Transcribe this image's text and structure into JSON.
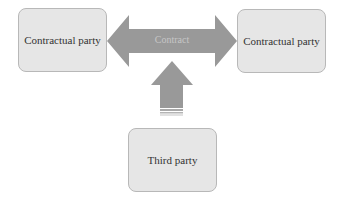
{
  "diagram": {
    "nodes": {
      "left": {
        "label": "Contractual party"
      },
      "right": {
        "label": "Contractual party"
      },
      "bottom": {
        "label": "Third party"
      }
    },
    "edges": {
      "contract": {
        "label": "Contract",
        "from": "Contractual party",
        "to": "Contractual party",
        "type": "double-arrow"
      },
      "influence": {
        "from": "Third party",
        "to": "Contract",
        "type": "up-arrow"
      }
    },
    "colors": {
      "box_fill": "#e6e6e6",
      "box_border": "#b8b8b8",
      "arrow_fill": "#999999",
      "arrow_text": "#c6c6c6",
      "node_text": "#333333"
    }
  }
}
